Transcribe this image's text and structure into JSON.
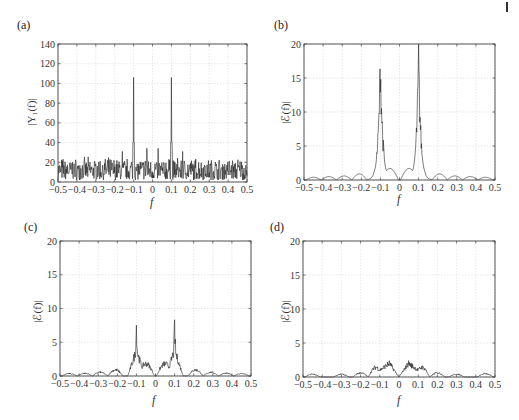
{
  "page": {
    "corner_mark": "|"
  },
  "chart_data": [
    {
      "id": "a",
      "panel_label": "(a)",
      "type": "line",
      "title": "",
      "xlabel": "f",
      "ylabel": "|Y₁(f)|",
      "xlim": [
        -0.5,
        0.5
      ],
      "ylim": [
        0,
        140
      ],
      "xticks": [
        -0.5,
        -0.4,
        -0.3,
        -0.2,
        -0.1,
        0,
        0.1,
        0.2,
        0.3,
        0.4,
        0.5
      ],
      "xtick_labels": [
        "−0.5",
        "−0.4",
        "−0.3",
        "−0.2",
        "−0.1",
        "0",
        "0.1",
        "0.2",
        "0.3",
        "0.4",
        "0.5"
      ],
      "yticks": [
        0,
        20,
        40,
        60,
        80,
        100,
        120,
        140
      ],
      "ytick_labels": [
        "0",
        "20",
        "40",
        "60",
        "80",
        "100",
        "120",
        "140"
      ],
      "grid": true,
      "description": "Noisy magnitude spectrum with noise floor ~5-25 and two sharp peaks at f=±0.1 reaching ~106",
      "peaks": [
        {
          "x": -0.1,
          "y": 106
        },
        {
          "x": 0.1,
          "y": 106
        }
      ],
      "secondary_spikes": [
        {
          "x": -0.16,
          "y": 31
        },
        {
          "x": -0.03,
          "y": 34
        },
        {
          "x": 0.03,
          "y": 34
        },
        {
          "x": 0.16,
          "y": 31
        }
      ],
      "noise_floor": {
        "min": 2,
        "max": 26,
        "mean": 12
      }
    },
    {
      "id": "b",
      "panel_label": "(b)",
      "type": "line",
      "title": "",
      "xlabel": "f",
      "ylabel": "|ℰ(f)|",
      "xlim": [
        -0.5,
        0.5
      ],
      "ylim": [
        0,
        20
      ],
      "xticks": [
        -0.5,
        -0.4,
        -0.3,
        -0.2,
        -0.1,
        0,
        0.1,
        0.2,
        0.3,
        0.4,
        0.5
      ],
      "xtick_labels": [
        "−0.5",
        "−0.4",
        "−0.3",
        "−0.2",
        "−0.1",
        "0",
        "0.1",
        "0.2",
        "0.3",
        "0.4",
        "0.5"
      ],
      "yticks": [
        0,
        5,
        10,
        15,
        20
      ],
      "ytick_labels": [
        "0",
        "5",
        "10",
        "15",
        "20"
      ],
      "grid": true,
      "description": "Sidelobe pattern with main peaks at f=±0.1 reaching ~17.2; inner lobes ~1.7; outer lobes decreasing ~0.9 to 0.4",
      "peaks": [
        {
          "x": -0.1,
          "y": 17.2
        },
        {
          "x": 0.1,
          "y": 17.2
        }
      ],
      "lobes": [
        {
          "x": -0.45,
          "y": 0.4
        },
        {
          "x": -0.37,
          "y": 0.5
        },
        {
          "x": -0.29,
          "y": 0.6
        },
        {
          "x": -0.21,
          "y": 0.9
        },
        {
          "x": -0.05,
          "y": 1.7
        },
        {
          "x": 0.05,
          "y": 1.7
        },
        {
          "x": 0.21,
          "y": 0.9
        },
        {
          "x": 0.29,
          "y": 0.6
        },
        {
          "x": 0.37,
          "y": 0.5
        },
        {
          "x": 0.45,
          "y": 0.4
        }
      ]
    },
    {
      "id": "c",
      "panel_label": "(c)",
      "type": "line",
      "title": "",
      "xlabel": "f",
      "ylabel": "|ℰ(f)|",
      "xlim": [
        -0.5,
        0.5
      ],
      "ylim": [
        0,
        20
      ],
      "xticks": [
        -0.5,
        -0.4,
        -0.3,
        -0.2,
        -0.1,
        0,
        0.1,
        0.2,
        0.3,
        0.4,
        0.5
      ],
      "xtick_labels": [
        "−0.5",
        "−0.4",
        "−0.3",
        "−0.2",
        "−0.1",
        "0",
        "0.1",
        "0.2",
        "0.3",
        "0.4",
        "0.5"
      ],
      "yticks": [
        0,
        5,
        10,
        15,
        20
      ],
      "ytick_labels": [
        "0",
        "5",
        "10",
        "15",
        "20"
      ],
      "grid": true,
      "description": "Reduced error spectrum; peaks at f=±0.1 reaching ~7.2 with noisy shoulders ~4; inner lobes ~1.8; outer lobes ~0.4-0.9",
      "peaks": [
        {
          "x": -0.1,
          "y": 7.2
        },
        {
          "x": 0.1,
          "y": 7.2
        }
      ],
      "lobes": [
        {
          "x": -0.45,
          "y": 0.35
        },
        {
          "x": -0.37,
          "y": 0.4
        },
        {
          "x": -0.29,
          "y": 0.55
        },
        {
          "x": -0.21,
          "y": 0.9
        },
        {
          "x": -0.05,
          "y": 1.8
        },
        {
          "x": 0.05,
          "y": 1.8
        },
        {
          "x": 0.21,
          "y": 0.9
        },
        {
          "x": 0.29,
          "y": 0.55
        },
        {
          "x": 0.37,
          "y": 0.4
        },
        {
          "x": 0.45,
          "y": 0.35
        }
      ]
    },
    {
      "id": "d",
      "panel_label": "(d)",
      "type": "line",
      "title": "",
      "xlabel": "f",
      "ylabel": "|ℰ(f)|",
      "xlim": [
        -0.5,
        0.5
      ],
      "ylim": [
        0,
        20
      ],
      "xticks": [
        -0.5,
        -0.4,
        -0.3,
        -0.2,
        -0.1,
        0,
        0.1,
        0.2,
        0.3,
        0.4,
        0.5
      ],
      "xtick_labels": [
        "−0.5",
        "−0.4",
        "−0.3",
        "−0.2",
        "−0.1",
        "0",
        "0.1",
        "0.2",
        "0.3",
        "0.4",
        "0.5"
      ],
      "yticks": [
        0,
        5,
        10,
        15,
        20
      ],
      "ytick_labels": [
        "0",
        "5",
        "10",
        "15",
        "20"
      ],
      "grid": true,
      "description": "Low error spectrum everywhere; max ~2 near f=±0.05; noisy ~1.2-1.5 around ±0.1; floor ~0.2-0.6",
      "peaks": [
        {
          "x": -0.05,
          "y": 2.0
        },
        {
          "x": 0.05,
          "y": 2.0
        }
      ],
      "lobes": [
        {
          "x": -0.45,
          "y": 0.4
        },
        {
          "x": -0.3,
          "y": 0.4
        },
        {
          "x": -0.2,
          "y": 0.6
        },
        {
          "x": -0.12,
          "y": 1.4
        },
        {
          "x": 0.12,
          "y": 1.4
        },
        {
          "x": 0.2,
          "y": 0.6
        },
        {
          "x": 0.3,
          "y": 0.4
        },
        {
          "x": 0.45,
          "y": 0.5
        }
      ]
    }
  ]
}
